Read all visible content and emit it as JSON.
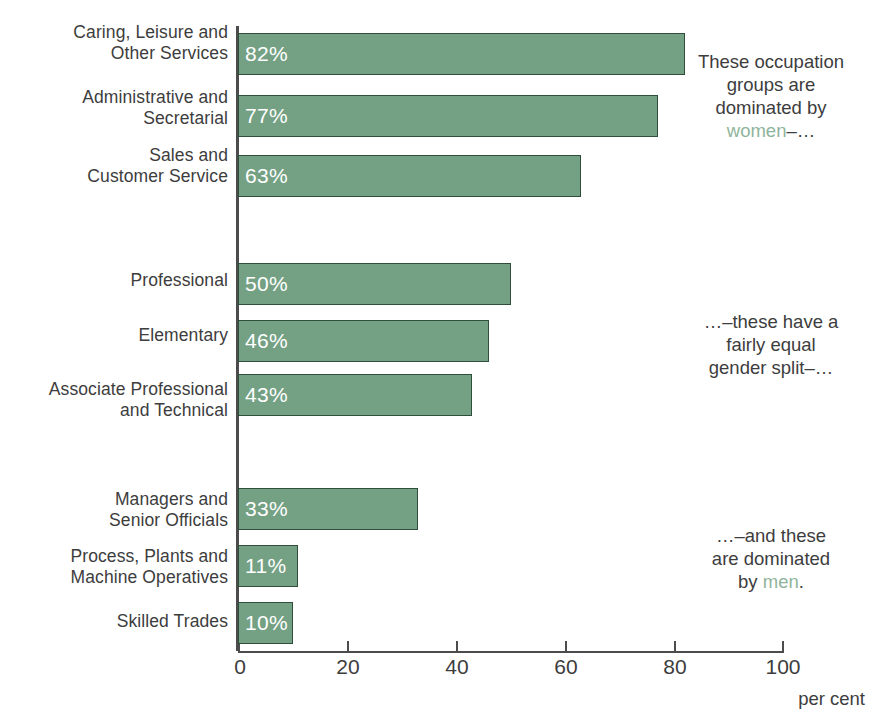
{
  "chart_data": {
    "type": "bar",
    "orientation": "horizontal",
    "title": "",
    "xlabel": "per cent",
    "ylabel": "",
    "xlim": [
      0,
      100
    ],
    "xticks": [
      0,
      20,
      40,
      60,
      80,
      100
    ],
    "grid": false,
    "legend": "none",
    "bar_color": "#74a184",
    "bar_outline_color": "#2f4f3c",
    "value_label_color": "#ffffff",
    "accent_color": "#8fb49c",
    "categories": [
      "Caring, Leisure and Other Services",
      "Administrative and Secretarial",
      "Sales and Customer Service",
      "Professional",
      "Elementary",
      "Associate Professional and Technical",
      "Managers and Senior Officials",
      "Process, Plants and Machine Operatives",
      "Skilled Trades"
    ],
    "values": [
      82,
      77,
      63,
      50,
      46,
      43,
      33,
      11,
      10
    ],
    "value_labels": [
      "82%",
      "77%",
      "63%",
      "50%",
      "46%",
      "43%",
      "33%",
      "11%",
      "10%"
    ],
    "groups": [
      {
        "name": "female-dominated",
        "indices": [
          0,
          1,
          2
        ]
      },
      {
        "name": "equal-split",
        "indices": [
          3,
          4,
          5
        ]
      },
      {
        "name": "male-dominated",
        "indices": [
          6,
          7,
          8
        ]
      }
    ]
  },
  "categories_wrapped": [
    [
      "Caring, Leisure and",
      "Other Services"
    ],
    [
      "Administrative and",
      "Secretarial"
    ],
    [
      "Sales and",
      "Customer Service"
    ],
    [
      "Professional"
    ],
    [
      "Elementary"
    ],
    [
      "Associate Professional",
      "and Technical"
    ],
    [
      "Managers and",
      "Senior Officials"
    ],
    [
      "Process, Plants and",
      "Machine Operatives"
    ],
    [
      "Skilled Trades"
    ]
  ],
  "cat0_l0": "Caring, Leisure and",
  "cat0_l1": "Other Services",
  "cat1_l0": "Administrative and",
  "cat1_l1": "Secretarial",
  "cat2_l0": "Sales and",
  "cat2_l1": "Customer Service",
  "cat3_l0": "Professional",
  "cat4_l0": "Elementary",
  "cat5_l0": "Associate Professional",
  "cat5_l1": "and Technical",
  "cat6_l0": "Managers and",
  "cat6_l1": "Senior Officials",
  "cat7_l0": "Process, Plants and",
  "cat7_l1": "Machine Operatives",
  "cat8_l0": "Skilled Trades",
  "val0": "82%",
  "val1": "77%",
  "val2": "63%",
  "val3": "50%",
  "val4": "46%",
  "val5": "43%",
  "val6": "33%",
  "val7": "11%",
  "val8": "10%",
  "axis": {
    "tick0": "0",
    "tick1": "20",
    "tick2": "40",
    "tick3": "60",
    "tick4": "80",
    "tick5": "100",
    "unit": "per cent"
  },
  "annotations": {
    "top": {
      "line1": "These occupation",
      "line2": "groups are",
      "line3": "dominated by",
      "accent": "women",
      "tail": "–…"
    },
    "middle": {
      "line1": "…–these have a",
      "line2": "fairly equal",
      "line3": "gender split–…"
    },
    "bottom": {
      "line1": "…–and these",
      "line2": "are dominated",
      "lead": "by ",
      "accent": "men",
      "tail": "."
    }
  }
}
